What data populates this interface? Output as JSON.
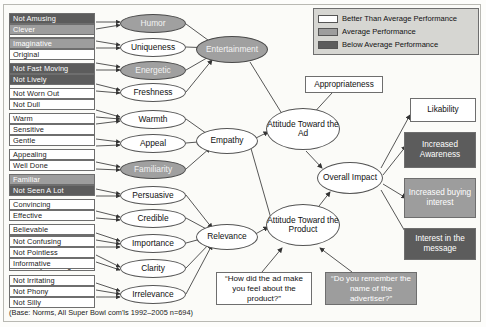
{
  "legend": {
    "items": [
      {
        "label": "Better Than Average Performance",
        "swatch": "white"
      },
      {
        "label": "Average Performance",
        "swatch": "mid"
      },
      {
        "label": "Below Average Performance",
        "swatch": "dark"
      }
    ]
  },
  "footnote": "(Base: Norms, All Super Bowl com'ls 1992–2005 n=694)",
  "colors": {
    "better_than_average": "#ffffff",
    "average": "#9d9d9d",
    "below_average": "#5c5c5c",
    "legend_background": "#d6d6d2",
    "border": "#6e6e6e"
  },
  "attributes": [
    {
      "label": "Not Amusing",
      "shade": "dark"
    },
    {
      "label": "Clever",
      "shade": "mid"
    },
    {
      "label": "Imaginative",
      "shade": "mid"
    },
    {
      "label": "Original",
      "shade": "white"
    },
    {
      "label": "Not Fast Moving",
      "shade": "dark"
    },
    {
      "label": "Not Lively",
      "shade": "dark"
    },
    {
      "label": "Not Worn Out",
      "shade": "white"
    },
    {
      "label": "Not Dull",
      "shade": "white"
    },
    {
      "label": "Warm",
      "shade": "white"
    },
    {
      "label": "Sensitive",
      "shade": "white"
    },
    {
      "label": "Gentle",
      "shade": "white"
    },
    {
      "label": "Appealing",
      "shade": "white"
    },
    {
      "label": "Well Done",
      "shade": "white"
    },
    {
      "label": "Familiar",
      "shade": "mid"
    },
    {
      "label": "Not Seen A Lot",
      "shade": "dark"
    },
    {
      "label": "Convincing",
      "shade": "white"
    },
    {
      "label": "Effective",
      "shade": "white"
    },
    {
      "label": "Believable",
      "shade": "white"
    },
    {
      "label": "True To Life",
      "shade": "white"
    },
    {
      "label": "Worth Remembering",
      "shade": "white"
    },
    {
      "label": "Not Easy To Forget",
      "shade": "white"
    },
    {
      "label": "Not Confusing",
      "shade": "white"
    },
    {
      "label": "Not Pointless",
      "shade": "white"
    },
    {
      "label": "Informative",
      "shade": "white"
    },
    {
      "label": "Not Irritating",
      "shade": "white"
    },
    {
      "label": "Not Phony",
      "shade": "white"
    },
    {
      "label": "Not Silly",
      "shade": "white"
    }
  ],
  "factors": [
    {
      "label": "Humor",
      "shade": "mid"
    },
    {
      "label": "Uniqueness",
      "shade": "white"
    },
    {
      "label": "Energetic",
      "shade": "mid"
    },
    {
      "label": "Freshness",
      "shade": "white"
    },
    {
      "label": "Warmth",
      "shade": "white"
    },
    {
      "label": "Appeal",
      "shade": "white"
    },
    {
      "label": "Familiarity",
      "shade": "mid"
    },
    {
      "label": "Persuasive",
      "shade": "white"
    },
    {
      "label": "Credible",
      "shade": "white"
    },
    {
      "label": "Importance",
      "shade": "white"
    },
    {
      "label": "Clarity",
      "shade": "white"
    },
    {
      "label": "Irrelevance",
      "shade": "white"
    }
  ],
  "dimensions": [
    {
      "label": "Entertainment",
      "shade": "mid"
    },
    {
      "label": "Empathy",
      "shade": "white"
    },
    {
      "label": "Relevance",
      "shade": "white"
    }
  ],
  "moderator": {
    "label": "Appropriateness",
    "shade": "white"
  },
  "attitudes": [
    {
      "label": "Attitude Toward the Ad",
      "shade": "white"
    },
    {
      "label": "Attitude Toward the Product",
      "shade": "white"
    }
  ],
  "overall": {
    "label": "Overall Impact",
    "shade": "white"
  },
  "outcomes": [
    {
      "label": "Likability",
      "shade": "white"
    },
    {
      "label": "Increased Awareness",
      "shade": "dark"
    },
    {
      "label": "Increased buying interest",
      "shade": "mid"
    },
    {
      "label": "Interest in the message",
      "shade": "dark"
    }
  ],
  "questions": [
    {
      "label": "“How did the ad make you feel about the product?”",
      "shade": "white"
    },
    {
      "label": "“Do you remember the name of the advertiser?”",
      "shade": "mid"
    }
  ]
}
